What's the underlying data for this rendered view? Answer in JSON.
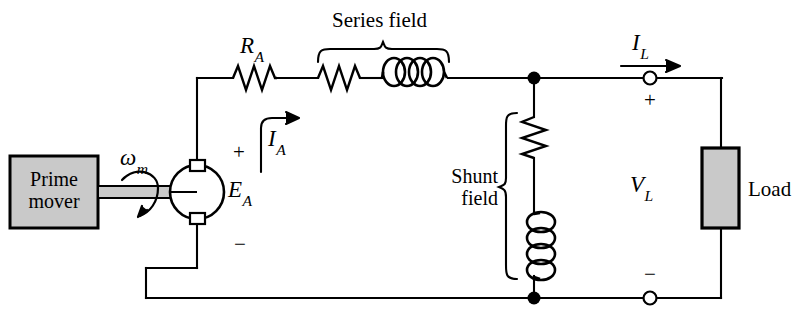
{
  "diagram": {
    "type": "compound-dc-generator-schematic",
    "colors": {
      "wire": "#000000",
      "background": "#ffffff",
      "box_fill": "#c8c8c8",
      "box_stroke": "#000000",
      "shaft_fill": "#c0c0c0"
    }
  },
  "labels": {
    "prime_mover_line1": "Prime",
    "prime_mover_line2": "mover",
    "omega_m": "ω",
    "omega_m_sub": "m",
    "armature_emf": "E",
    "armature_emf_sub": "A",
    "armature_current": "I",
    "armature_current_sub": "A",
    "armature_resistance": "R",
    "armature_resistance_sub": "A",
    "series_field": "Series field",
    "shunt_field_line1": "Shunt",
    "shunt_field_line2": "field",
    "load_current": "I",
    "load_current_sub": "L",
    "load_voltage": "V",
    "load_voltage_sub": "L",
    "load": "Load",
    "plus_armature": "+",
    "minus_armature": "−",
    "plus_terminal": "+",
    "minus_terminal": "−"
  },
  "components": {
    "prime_mover_box": {
      "x": 10,
      "y": 156,
      "w": 88,
      "h": 72
    },
    "generator_circle": {
      "cx": 197,
      "cy": 192,
      "r": 27
    },
    "armature_resistor": {
      "x1": 233,
      "x2": 277,
      "y": 78
    },
    "series_resistor": {
      "x1": 318,
      "x2": 360,
      "y": 78
    },
    "series_inductor": {
      "x1": 382,
      "x2": 448,
      "y": 78,
      "loops": 5
    },
    "shunt_resistor": {
      "x": 534,
      "y1": 117,
      "y2": 158
    },
    "shunt_inductor": {
      "x": 534,
      "y1": 214,
      "y2": 276,
      "loops": 4
    },
    "load_box": {
      "x": 702,
      "y": 148,
      "w": 36,
      "h": 80
    },
    "junction_top": {
      "x": 534,
      "y": 78
    },
    "junction_bottom": {
      "x": 534,
      "y": 298
    },
    "terminal_top": {
      "x": 650,
      "y": 78
    },
    "terminal_bottom": {
      "x": 650,
      "y": 298
    }
  }
}
